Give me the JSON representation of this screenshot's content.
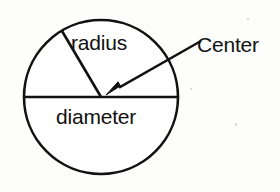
{
  "diagram": {
    "kind": "circle-parts-diagram",
    "background_color": "#fdfdfc",
    "ink_color": "#111111",
    "labels": {
      "radius": "radius",
      "diameter": "diameter",
      "center": "Center"
    },
    "geometry": {
      "circle": {
        "center_x": 101,
        "center_y": 97,
        "radius": 77,
        "stroke_width": 2.6,
        "fill": "#ffffff"
      },
      "diameter_line": {
        "x1": 24,
        "y1": 97,
        "x2": 178,
        "y2": 97,
        "stroke_width": 2.6
      },
      "radius_line": {
        "x1": 101,
        "y1": 97,
        "x2": 62,
        "y2": 31,
        "stroke_width": 2.6
      },
      "center_arrow": {
        "x1": 201,
        "y1": 41,
        "x2": 106,
        "y2": 95,
        "stroke_width": 2.4,
        "head_length": 17,
        "head_width": 11
      }
    }
  }
}
